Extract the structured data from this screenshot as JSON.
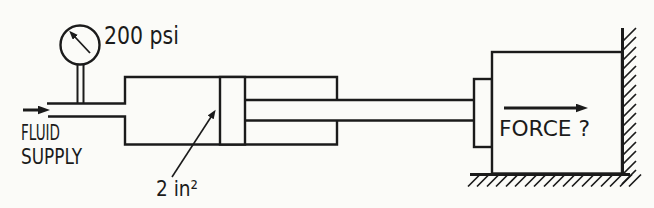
{
  "figure": {
    "colors": {
      "ink": "#1b1b1b",
      "paper": "#fbfbf8"
    },
    "gauge": {
      "reading": "200 psi"
    },
    "supply": {
      "line1": "FLUID",
      "line2": "SUPPLY"
    },
    "piston": {
      "area_label": "2 in²"
    },
    "load": {
      "force_label": "FORCE ?"
    }
  }
}
